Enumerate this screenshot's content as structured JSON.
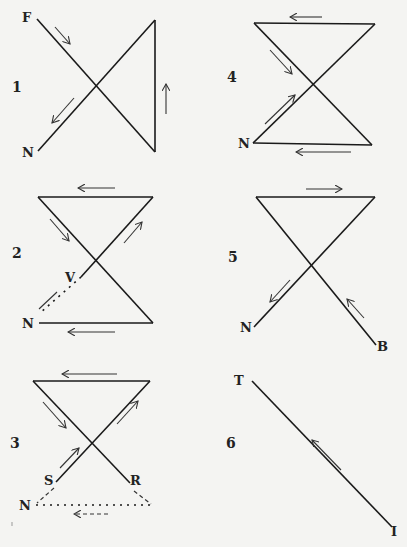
{
  "figures": [
    {
      "number": "1",
      "labels": [
        "F",
        "N"
      ]
    },
    {
      "number": "2",
      "labels": [
        "V",
        "N"
      ]
    },
    {
      "number": "3",
      "labels": [
        "S",
        "R",
        "N"
      ]
    },
    {
      "number": "4",
      "labels": [
        "N"
      ]
    },
    {
      "number": "5",
      "labels": [
        "N",
        "B"
      ]
    },
    {
      "number": "6",
      "labels": [
        "T",
        "I"
      ]
    }
  ],
  "colors": {
    "background": "#f4f4f2",
    "ink": "#1a1a1a"
  }
}
